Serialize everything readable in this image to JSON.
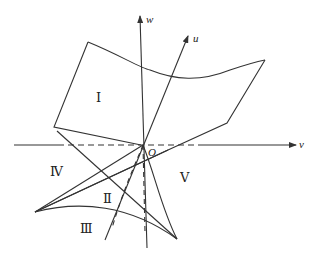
{
  "figure": {
    "title": "",
    "stroke_color": "#333333",
    "background": "#ffffff"
  },
  "axes": {
    "u": {
      "label": "u"
    },
    "v": {
      "label": "v"
    },
    "w": {
      "label": "w"
    },
    "origin": {
      "label": "O"
    }
  },
  "regions": [
    {
      "id": "I",
      "label": "Ⅰ"
    },
    {
      "id": "II",
      "label": "Ⅱ"
    },
    {
      "id": "III",
      "label": "Ⅲ"
    },
    {
      "id": "IV",
      "label": "Ⅳ"
    },
    {
      "id": "V",
      "label": "Ⅴ"
    }
  ]
}
